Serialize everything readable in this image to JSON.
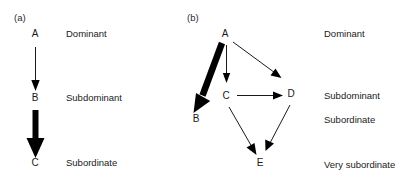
{
  "figure": {
    "background_color": "#ffffff",
    "ink_color": "#1a1a1a",
    "panels": [
      {
        "id": "a",
        "label": "(a)",
        "nodes": [
          {
            "id": "A",
            "label": "A",
            "x": 35,
            "y": 37
          },
          {
            "id": "B",
            "label": "B",
            "x": 35,
            "y": 101
          },
          {
            "id": "C",
            "label": "C",
            "x": 35,
            "y": 166
          }
        ],
        "rank_labels": [
          {
            "text": "Dominant",
            "x": 66,
            "y": 37
          },
          {
            "text": "Subdominant",
            "x": 66,
            "y": 101
          },
          {
            "text": "Subordinate",
            "x": 66,
            "y": 166
          }
        ],
        "edges": [
          {
            "from": "A",
            "to": "B",
            "weight": "thin",
            "stroke_width": 1
          },
          {
            "from": "B",
            "to": "C",
            "weight": "thick",
            "stroke_width": 6
          }
        ]
      },
      {
        "id": "b",
        "label": "(b)",
        "nodes": [
          {
            "id": "A",
            "label": "A",
            "x": 225,
            "y": 37
          },
          {
            "id": "C",
            "label": "C",
            "x": 226,
            "y": 99
          },
          {
            "id": "D",
            "label": "D",
            "x": 291,
            "y": 97
          },
          {
            "id": "B",
            "label": "B",
            "x": 196,
            "y": 122
          },
          {
            "id": "E",
            "label": "E",
            "x": 260,
            "y": 166
          }
        ],
        "rank_labels": [
          {
            "text": "Dominant",
            "x": 324,
            "y": 37
          },
          {
            "text": "Subdominant",
            "x": 324,
            "y": 99
          },
          {
            "text": "Subordinate",
            "x": 324,
            "y": 123
          },
          {
            "text": "Very subordinate",
            "x": 324,
            "y": 168
          }
        ],
        "edges": [
          {
            "from": "A",
            "to": "B",
            "weight": "thick",
            "stroke_width": 6
          },
          {
            "from": "A",
            "to": "C",
            "weight": "thin",
            "stroke_width": 1
          },
          {
            "from": "A",
            "to": "D",
            "weight": "thin",
            "stroke_width": 1
          },
          {
            "from": "C",
            "to": "D",
            "weight": "thin",
            "stroke_width": 1
          },
          {
            "from": "C",
            "to": "E",
            "weight": "thin",
            "stroke_width": 1
          },
          {
            "from": "D",
            "to": "E",
            "weight": "thin",
            "stroke_width": 1
          }
        ]
      }
    ]
  }
}
